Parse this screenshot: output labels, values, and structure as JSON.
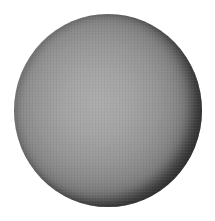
{
  "image": {
    "subject": "shaded gray sphere",
    "background_color": "#ffffff",
    "sphere": {
      "center": [
        107,
        110
      ],
      "size": [
        188,
        193
      ],
      "highlight_color": "#acacac",
      "midtone_color": "#7c7c7c",
      "rim_color": "#141414",
      "light_direction": "upper-left"
    }
  }
}
